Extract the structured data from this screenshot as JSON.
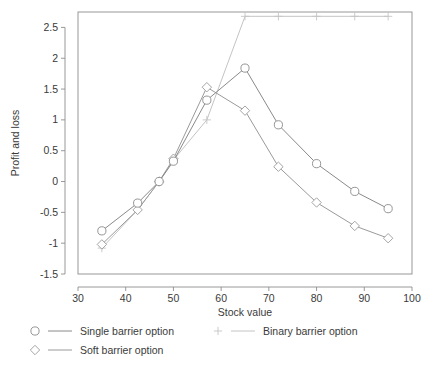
{
  "chart_data": {
    "type": "line",
    "title": "",
    "xlabel": "Stock value",
    "ylabel": "Profit and loss",
    "xlim": [
      30,
      100
    ],
    "ylim": [
      -1.5,
      2.75
    ],
    "xticks": [
      30,
      40,
      50,
      60,
      70,
      80,
      90,
      100
    ],
    "yticks": [
      -1.5,
      -1,
      -0.5,
      0,
      0.5,
      1,
      1.5,
      2,
      2.5
    ],
    "xtick_labels": [
      "30",
      "40",
      "50",
      "60",
      "70",
      "80",
      "90",
      "100"
    ],
    "ytick_labels": [
      "-1.5",
      "-1",
      "-0.5",
      "0",
      "0.5",
      "1",
      "1.5",
      "2",
      "2.5"
    ],
    "grid": false,
    "legend_position": "below-axes",
    "series": [
      {
        "name": "Single barrier option",
        "marker": "circle",
        "color": "#8a8a8a",
        "x": [
          35,
          42.5,
          47,
          50,
          57,
          65,
          72,
          80,
          88,
          95
        ],
        "y": [
          -0.8,
          -0.35,
          0.0,
          0.33,
          1.32,
          1.84,
          0.92,
          0.29,
          -0.16,
          -0.44
        ]
      },
      {
        "name": "Soft barrier option",
        "marker": "diamond",
        "color": "#9a9a9a",
        "x": [
          35,
          42.5,
          47,
          50,
          57,
          65,
          72,
          80,
          88,
          95
        ],
        "y": [
          -1.02,
          -0.46,
          0.0,
          0.37,
          1.53,
          1.15,
          0.24,
          -0.34,
          -0.72,
          -0.92
        ]
      },
      {
        "name": "Binary barrier option",
        "marker": "plus",
        "color": "#c4c4c4",
        "x": [
          35,
          42.5,
          47,
          50,
          57,
          65,
          72,
          80,
          88,
          95
        ],
        "y": [
          -1.08,
          -0.46,
          0.0,
          0.35,
          1.0,
          2.68,
          2.68,
          2.68,
          2.68,
          2.68
        ]
      }
    ]
  },
  "legend": {
    "entries": [
      {
        "label": "Single barrier option",
        "marker": "circle-icon",
        "color": "#8a8a8a"
      },
      {
        "label": "Binary barrier option",
        "marker": "plus-icon",
        "color": "#c4c4c4"
      },
      {
        "label": "Soft barrier option",
        "marker": "diamond-icon",
        "color": "#9a9a9a"
      }
    ]
  }
}
